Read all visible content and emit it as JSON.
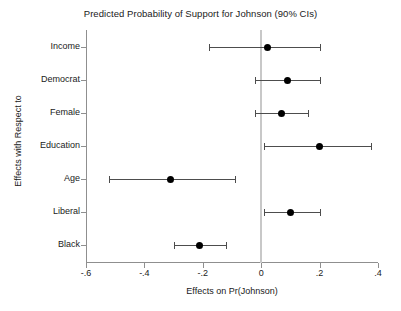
{
  "chart_data": {
    "type": "scatter",
    "title": "Predicted Probability of Support for Johnson (90% CIs)",
    "xlabel": "Effects on Pr(Johnson)",
    "ylabel": "Effects with Respect to",
    "xlim": [
      -0.6,
      0.4
    ],
    "xticks": [
      -0.6,
      -0.4,
      -0.2,
      0,
      0.2,
      0.4
    ],
    "xticklabels": [
      "-.6",
      "-.4",
      "-.2",
      "0",
      ".2",
      ".4"
    ],
    "grid": false,
    "legend": null,
    "zero_reference_line": 0,
    "categories": [
      "Income",
      "Democrat",
      "Female",
      "Education",
      "Age",
      "Liberal",
      "Black"
    ],
    "values": [
      0.02,
      0.09,
      0.07,
      0.2,
      -0.31,
      0.1,
      -0.21
    ],
    "ci_low": [
      -0.18,
      -0.02,
      -0.02,
      0.01,
      -0.52,
      0.01,
      -0.3
    ],
    "ci_high": [
      0.2,
      0.2,
      0.16,
      0.375,
      -0.09,
      0.2,
      -0.12
    ],
    "points": [
      {
        "label": "Income",
        "estimate": 0.02,
        "ci_low": -0.18,
        "ci_high": 0.2
      },
      {
        "label": "Democrat",
        "estimate": 0.09,
        "ci_low": -0.02,
        "ci_high": 0.2
      },
      {
        "label": "Female",
        "estimate": 0.07,
        "ci_low": -0.02,
        "ci_high": 0.16
      },
      {
        "label": "Education",
        "estimate": 0.2,
        "ci_low": 0.01,
        "ci_high": 0.375
      },
      {
        "label": "Age",
        "estimate": -0.31,
        "ci_low": -0.52,
        "ci_high": -0.09
      },
      {
        "label": "Liberal",
        "estimate": 0.1,
        "ci_low": 0.01,
        "ci_high": 0.2
      },
      {
        "label": "Black",
        "estimate": -0.21,
        "ci_low": -0.3,
        "ci_high": -0.12
      }
    ]
  },
  "colors": {
    "marker": "#000000",
    "interval": "#4d4d4d",
    "axis": "#8f8f8f",
    "zero_line": "#c8c8c8",
    "text": "#1a1a1a",
    "background": "#ffffff"
  }
}
